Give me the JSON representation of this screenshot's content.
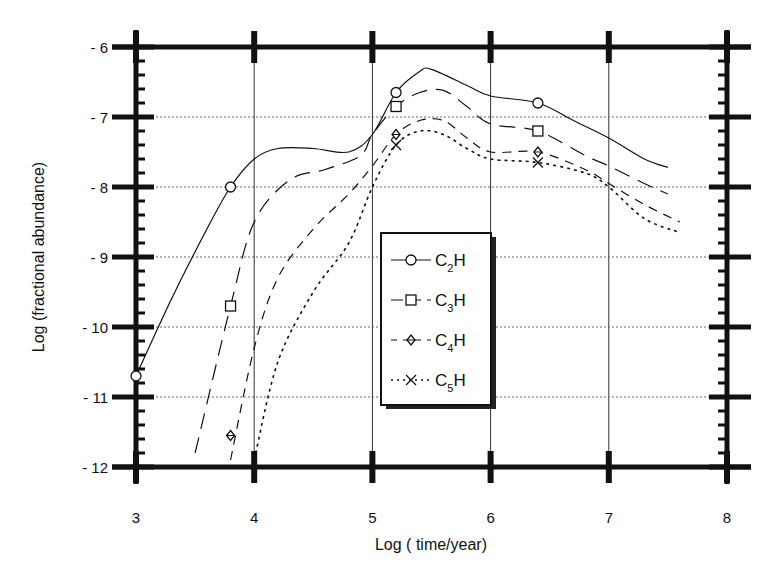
{
  "chart_data": {
    "type": "line",
    "title": "",
    "xlabel": "Log ( time/year)",
    "ylabel": "Log (fractional abundance)",
    "xlim": [
      3,
      8
    ],
    "ylim": [
      -12,
      -6
    ],
    "x_ticks": [
      "3",
      "4",
      "5",
      "6",
      "7",
      "8"
    ],
    "y_ticks": [
      "- 6",
      "- 7",
      "- 8",
      "- 9",
      "- 10",
      "- 11",
      "- 12"
    ],
    "grid": "dotted",
    "legend_position": "center (inside, x≈5.1-6.0)",
    "series": [
      {
        "name": "C2H",
        "style": "solid",
        "marker": "circle",
        "x": [
          3.0,
          3.3,
          3.6,
          3.8,
          4.0,
          4.2,
          4.5,
          4.8,
          5.0,
          5.2,
          5.4,
          5.5,
          5.8,
          6.0,
          6.4,
          6.7,
          7.0,
          7.3,
          7.5
        ],
        "y": [
          -10.7,
          -9.6,
          -8.6,
          -8.0,
          -7.6,
          -7.45,
          -7.45,
          -7.5,
          -7.25,
          -6.65,
          -6.35,
          -6.32,
          -6.55,
          -6.7,
          -6.8,
          -7.05,
          -7.3,
          -7.6,
          -7.72
        ],
        "marker_points": [
          [
            3.0,
            -10.7
          ],
          [
            3.8,
            -8.0
          ],
          [
            5.2,
            -6.65
          ],
          [
            6.4,
            -6.8
          ]
        ]
      },
      {
        "name": "C3H",
        "style": "long-dash",
        "marker": "square",
        "x": [
          3.5,
          3.8,
          4.0,
          4.3,
          4.6,
          4.9,
          5.0,
          5.2,
          5.4,
          5.6,
          5.8,
          6.0,
          6.4,
          6.8,
          7.0,
          7.3,
          7.5
        ],
        "y": [
          -11.8,
          -9.7,
          -8.5,
          -7.9,
          -7.75,
          -7.55,
          -7.25,
          -6.85,
          -6.65,
          -6.62,
          -6.85,
          -7.1,
          -7.2,
          -7.55,
          -7.7,
          -7.95,
          -8.1
        ],
        "marker_points": [
          [
            3.8,
            -9.7
          ],
          [
            5.2,
            -6.85
          ],
          [
            6.4,
            -7.2
          ]
        ]
      },
      {
        "name": "C4H",
        "style": "dashed",
        "marker": "diamond",
        "x": [
          3.8,
          4.0,
          4.2,
          4.5,
          4.8,
          5.0,
          5.2,
          5.4,
          5.6,
          5.8,
          6.0,
          6.4,
          6.8,
          7.0,
          7.3,
          7.6
        ],
        "y": [
          -11.9,
          -10.3,
          -9.3,
          -8.6,
          -8.1,
          -7.7,
          -7.25,
          -7.05,
          -7.05,
          -7.3,
          -7.5,
          -7.5,
          -7.75,
          -7.95,
          -8.25,
          -8.5
        ],
        "marker_points": [
          [
            3.8,
            -11.55
          ],
          [
            5.2,
            -7.25
          ],
          [
            6.4,
            -7.5
          ]
        ]
      },
      {
        "name": "C5H",
        "style": "dotted",
        "marker": "x",
        "x": [
          4.0,
          4.2,
          4.5,
          4.8,
          5.0,
          5.2,
          5.4,
          5.6,
          5.8,
          6.0,
          6.4,
          6.8,
          7.0,
          7.3,
          7.6
        ],
        "y": [
          -11.9,
          -10.5,
          -9.5,
          -8.8,
          -8.0,
          -7.4,
          -7.2,
          -7.25,
          -7.45,
          -7.6,
          -7.65,
          -7.8,
          -8.0,
          -8.45,
          -8.65
        ],
        "marker_points": [
          [
            5.2,
            -7.4
          ],
          [
            6.4,
            -7.65
          ]
        ]
      }
    ]
  },
  "axes": {
    "xlabel": "Log ( time/year)",
    "ylabel": "Log (fractional abundance)",
    "x_ticks": [
      "3",
      "4",
      "5",
      "6",
      "7",
      "8"
    ],
    "y_ticks": [
      "- 6",
      "- 7",
      "- 8",
      "- 9",
      "- 10",
      "- 11",
      "- 12"
    ]
  },
  "legend": {
    "items": [
      {
        "base": "C",
        "sub": "2",
        "tail": "H"
      },
      {
        "base": "C",
        "sub": "3",
        "tail": "H"
      },
      {
        "base": "C",
        "sub": "4",
        "tail": "H"
      },
      {
        "base": "C",
        "sub": "5",
        "tail": "H"
      }
    ]
  }
}
